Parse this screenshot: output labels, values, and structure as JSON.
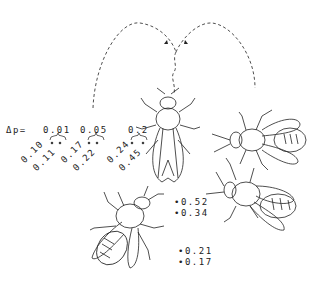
{
  "delta_label": "Δp=",
  "groups": [
    {
      "dp": "0.01",
      "a": "0.10",
      "b": "0.11"
    },
    {
      "dp": "0.05",
      "a": "0.17",
      "b": "0.22"
    },
    {
      "dp": "0.2",
      "a": "0.24",
      "b": "0.45"
    }
  ],
  "right_pair": {
    "a": "•0.52",
    "b": "•0.34"
  },
  "bottom_pair": {
    "a": "•0.21",
    "b": "•0.17"
  },
  "colors": {
    "ink": "#222222",
    "background": "#ffffff"
  }
}
